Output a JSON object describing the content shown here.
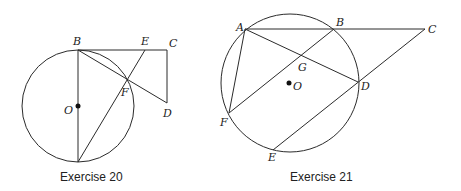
{
  "figures": [
    {
      "caption": "Exercise 20",
      "circle": {
        "cx": 78,
        "cy": 106,
        "r": 56
      },
      "center_label": "O",
      "points": {
        "B": {
          "x": 78,
          "y": 50,
          "label": "B"
        },
        "E": {
          "x": 145,
          "y": 50,
          "label": "E"
        },
        "C": {
          "x": 167,
          "y": 50,
          "label": "C"
        },
        "F": {
          "x": 127,
          "y": 79,
          "label": "F"
        },
        "D": {
          "x": 167,
          "y": 103,
          "label": "D"
        },
        "O": {
          "x": 78,
          "y": 106,
          "label": "O"
        },
        "A": {
          "x": 78,
          "y": 162
        }
      },
      "segments": [
        [
          "B",
          "C"
        ],
        [
          "C",
          "D"
        ],
        [
          "B",
          "D"
        ],
        [
          "B",
          "A"
        ],
        [
          "A",
          "E"
        ]
      ]
    },
    {
      "caption": "Exercise 21",
      "circle": {
        "cx": 290,
        "cy": 83,
        "r": 69
      },
      "center_label": "O",
      "points": {
        "A": {
          "x": 245,
          "y": 29,
          "label": "A"
        },
        "B": {
          "x": 334,
          "y": 29,
          "label": "B"
        },
        "C": {
          "x": 425,
          "y": 29,
          "label": "C"
        },
        "G": {
          "x": 302,
          "y": 55,
          "label": "G"
        },
        "D": {
          "x": 358,
          "y": 82,
          "label": "D"
        },
        "O": {
          "x": 289,
          "y": 83,
          "label": "O"
        },
        "F": {
          "x": 229,
          "y": 113,
          "label": "F"
        },
        "E": {
          "x": 273,
          "y": 150,
          "label": "E"
        }
      },
      "segments": [
        [
          "A",
          "C"
        ],
        [
          "A",
          "D"
        ],
        [
          "A",
          "F"
        ],
        [
          "F",
          "B"
        ],
        [
          "C",
          "E"
        ]
      ]
    }
  ]
}
